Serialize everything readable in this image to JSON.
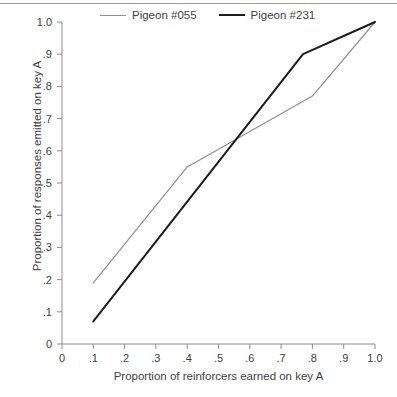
{
  "chart_data": {
    "type": "line",
    "title": "",
    "xlabel": "Proportion of reinforcers earned on key A",
    "ylabel": "Proportion of responses emitted on key A",
    "xlim": [
      0,
      1.0
    ],
    "ylim": [
      0,
      1.0
    ],
    "grid": false,
    "legend_position": "top",
    "xticks": [
      "0",
      ".1",
      ".2",
      ".3",
      ".4",
      ".5",
      ".6",
      ".7",
      ".8",
      ".9",
      "1.0"
    ],
    "xtick_values": [
      0,
      0.1,
      0.2,
      0.3,
      0.4,
      0.5,
      0.6,
      0.7,
      0.8,
      0.9,
      1.0
    ],
    "yticks": [
      "0",
      ".1",
      ".2",
      ".3",
      ".4",
      ".5",
      ".6",
      ".7",
      ".8",
      ".9",
      "1.0"
    ],
    "ytick_values": [
      0,
      0.1,
      0.2,
      0.3,
      0.4,
      0.5,
      0.6,
      0.7,
      0.8,
      0.9,
      1.0
    ],
    "series": [
      {
        "name": "Pigeon #055",
        "color": "#8f8f8f",
        "width": 1.2,
        "x": [
          0.1,
          0.4,
          0.8,
          1.0
        ],
        "y": [
          0.19,
          0.55,
          0.77,
          1.0
        ]
      },
      {
        "name": "Pigeon #231",
        "color": "#1b1b1b",
        "width": 2.0,
        "x": [
          0.1,
          0.77,
          1.0
        ],
        "y": [
          0.07,
          0.9,
          1.0
        ]
      }
    ]
  },
  "legend": {
    "entries": [
      {
        "label": "Pigeon #055"
      },
      {
        "label": "Pigeon #231"
      }
    ]
  },
  "axes": {
    "x_title": "Proportion of reinforcers earned on key A",
    "y_title": "Proportion of responses emitted on key A"
  },
  "colors": {
    "axis": "#8c8c8c",
    "text": "#3f3f3f",
    "series_055": "#8f8f8f",
    "series_231": "#1b1b1b",
    "rule": "#9a9a9a"
  }
}
